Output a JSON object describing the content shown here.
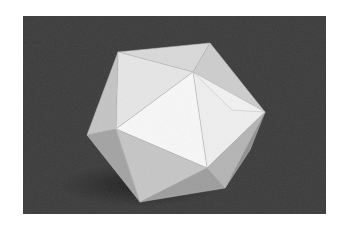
{
  "figure": {
    "caption": "",
    "colors": {
      "background": "#3a3a3a",
      "shadow": "#262626",
      "face_brightest": "#f7f7f7",
      "face_light": "#e4e4e4",
      "face_mid": "#cfcfcf",
      "face_dark": "#a9a9a9",
      "face_darkest": "#8c8c8c"
    }
  }
}
